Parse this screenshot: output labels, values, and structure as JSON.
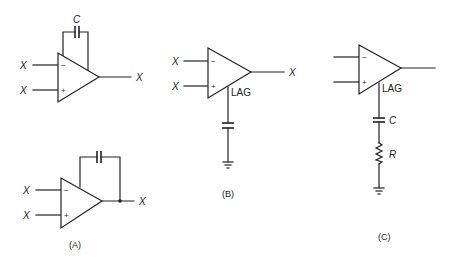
{
  "figure": {
    "panels": [
      {
        "id": "A",
        "caption": "(A)",
        "circuits": [
          {
            "name": "integrator-top",
            "inputs": [
              {
                "label": "X",
                "sign": "−"
              },
              {
                "label": "X",
                "sign": "+"
              }
            ],
            "output_label": "X",
            "feedback_label": "C"
          },
          {
            "name": "integrator-bottom",
            "inputs": [
              {
                "label": "X",
                "sign": "−"
              },
              {
                "label": "X",
                "sign": "+"
              }
            ],
            "output_label": "X",
            "feedback_label": ""
          }
        ]
      },
      {
        "id": "B",
        "caption": "(B)",
        "inputs": [
          {
            "label": "X",
            "sign": "−"
          },
          {
            "label": "X",
            "sign": "+"
          }
        ],
        "output_label": "X",
        "pin_label": "LAG"
      },
      {
        "id": "C",
        "caption": "(C)",
        "inputs": [
          {
            "label": "",
            "sign": "−"
          },
          {
            "label": "",
            "sign": "+"
          }
        ],
        "output_label": "",
        "pin_label": "LAG",
        "capacitor_label": "C",
        "resistor_label": "R"
      }
    ]
  }
}
